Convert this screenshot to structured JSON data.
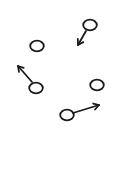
{
  "diagram": {
    "background": "#ffffff",
    "ink_color": "#1a1a1a",
    "particles": [
      {
        "id": "p1",
        "cx": 90,
        "cy": 25,
        "r": 6,
        "arrow": {
          "x1": 86,
          "y1": 31,
          "x2": 78,
          "y2": 45
        }
      },
      {
        "id": "p2",
        "cx": 37,
        "cy": 46,
        "r": 6,
        "arrow": null
      },
      {
        "id": "p3",
        "cx": 36,
        "cy": 88,
        "r": 6,
        "arrow": {
          "x1": 32,
          "y1": 82,
          "x2": 18,
          "y2": 66
        }
      },
      {
        "id": "p4",
        "cx": 97,
        "cy": 85,
        "r": 6,
        "arrow": null
      },
      {
        "id": "p5",
        "cx": 67,
        "cy": 115,
        "r": 6,
        "arrow": {
          "x1": 73,
          "y1": 113,
          "x2": 99,
          "y2": 105
        }
      }
    ]
  }
}
